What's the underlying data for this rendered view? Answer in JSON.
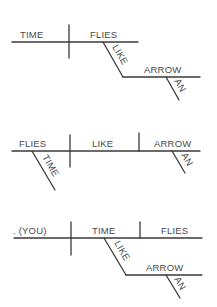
{
  "diagrams": [
    {
      "id": "diagram-1",
      "labels": {
        "subject": "TIME",
        "verb": "FLIES",
        "preposition": "LIKE",
        "object": "ARROW",
        "article": "AN"
      }
    },
    {
      "id": "diagram-2",
      "labels": {
        "subject": "FLIES",
        "modifier": "TIME",
        "verb": "LIKE",
        "object": "ARROW",
        "article": "AN"
      }
    },
    {
      "id": "diagram-3",
      "labels": {
        "subject": ". (YOU)",
        "verb": "TIME",
        "object": "FLIES",
        "preposition": "LIKE",
        "prep_object": "ARROW",
        "article": "AN"
      }
    }
  ],
  "colors": {
    "line": "#3a3a3a",
    "text": "#4a4a4a",
    "background": "#ffffff"
  }
}
